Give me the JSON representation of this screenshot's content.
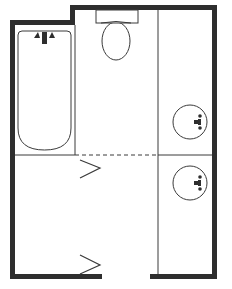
{
  "diagram": {
    "type": "floor-plan",
    "colors": {
      "wall": "#2e2e2e",
      "line": "#3a3a3a",
      "background": "#ffffff"
    },
    "rooms": [
      {
        "name": "tub-area",
        "fixture": "bathtub"
      },
      {
        "name": "toilet-area",
        "fixture": "toilet"
      },
      {
        "name": "vanity-area",
        "fixtures": [
          "sink",
          "sink"
        ]
      },
      {
        "name": "entry-area",
        "fixture": "none"
      }
    ],
    "fixtures": {
      "bathtub": {
        "count": 1
      },
      "toilet": {
        "count": 1
      },
      "sinks": {
        "count": 2
      }
    },
    "openings": {
      "door_gaps": 1,
      "swing_marks": 2
    }
  }
}
